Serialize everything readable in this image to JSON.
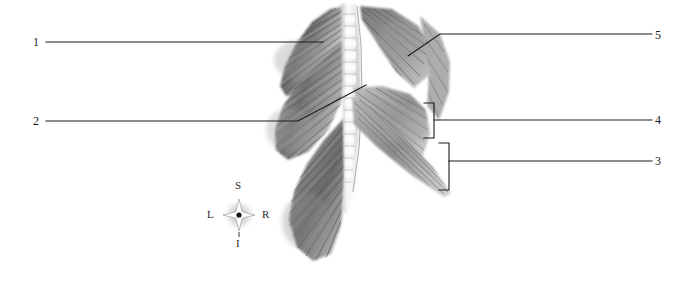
{
  "figure": {
    "background_color": "#ffffff",
    "line_color": "#1a1a1a",
    "width": 696,
    "height": 285
  },
  "labels": [
    {
      "id": "1",
      "text": "1",
      "side": "left",
      "type": "leader-line"
    },
    {
      "id": "2",
      "text": "2",
      "side": "left",
      "type": "leader-line"
    },
    {
      "id": "3",
      "text": "3",
      "side": "right",
      "type": "bracket"
    },
    {
      "id": "4",
      "text": "4",
      "side": "right",
      "type": "bracket"
    },
    {
      "id": "5",
      "text": "5",
      "side": "right",
      "type": "leader-line"
    }
  ],
  "compass": {
    "name": "anatomical-orientation-rosette",
    "superior": "S",
    "inferior": "I",
    "left": "L",
    "right": "R",
    "star_color": "#ffffff",
    "center_dot_color": "#111111",
    "halo_color": "#9a9a9a"
  },
  "illustration": {
    "name": "back-muscles-illustration",
    "style": "grayscale airbrush anatomical drawing",
    "regions": [
      {
        "name": "trapezius-fibers",
        "shade": "#6e6e6e"
      },
      {
        "name": "vertebral-column",
        "shade": "#f2f2f2"
      },
      {
        "name": "latissimus-dorsi-flap",
        "shade": "#8a8a8a"
      },
      {
        "name": "erector-spinae-band",
        "shade": "#777777"
      },
      {
        "name": "serratus-fan",
        "shade": "#5f5f5f"
      }
    ]
  }
}
